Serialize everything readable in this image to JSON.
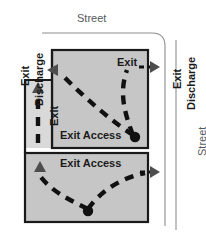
{
  "diagram": {
    "type": "egress-plan",
    "colors": {
      "room_fill": "#c6c6c6",
      "corridor_fill": "#d9d9d9",
      "wall": "#1a1a1a",
      "street_line": "#8a8e91",
      "street_text": "#55595c",
      "path": "#111111",
      "arrow": "#4d4d4d",
      "background": "#ffffff"
    },
    "labels": {
      "street_top": "Street",
      "street_right": "Street",
      "exit_discharge_left_line1": "Exit",
      "exit_discharge_left_line2": "Discharge",
      "exit_discharge_right_line1": "Exit",
      "exit_discharge_right_line2": "Discharge",
      "exit_corridor": "Exit",
      "exit_upper_right": "Exit",
      "exit_access_upper": "Exit Access",
      "exit_access_lower": "Exit Access"
    },
    "elements": {
      "occupant_upper": "occupant-point",
      "occupant_lower": "occupant-point",
      "arrow_left_top": "exit-discharge-arrow-left",
      "arrow_corridor_up": "exit-discharge-arrow-corridor",
      "arrow_lower_up": "exit-access-arrow-up",
      "arrow_right_upper": "exit-discharge-arrow-right-upper",
      "arrow_right_lower": "exit-discharge-arrow-right-lower"
    }
  }
}
